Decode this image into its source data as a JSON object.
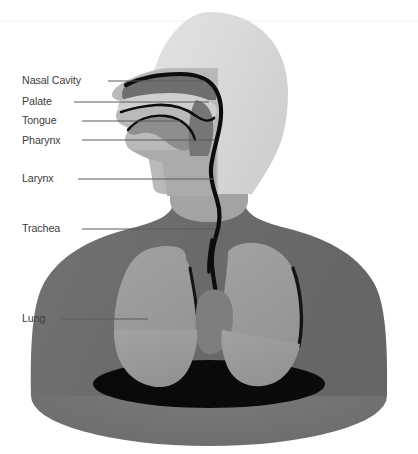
{
  "figure": {
    "width": 418,
    "height": 454,
    "background_color": "#ffffff"
  },
  "palette": {
    "background": "#ffffff",
    "skull_light": "#dcdcdc",
    "head_mid": "#c8c8c8",
    "face_shade": "#b4b4b4",
    "neck": "#a8a8a8",
    "torso": "#6e6e6e",
    "torso_base": "#757575",
    "lung": "#9a9a9a",
    "airway_dark": "#555555",
    "nasal_cavity": "#6f6f6f",
    "outline_black": "#0d0d0d",
    "shadow_black": "#0a0a0a",
    "label_text": "#3c3c3c",
    "leader_line": "#5a5a5a"
  },
  "labels": [
    {
      "id": "nasal-cavity",
      "text": "Nasal Cavity",
      "text_x": 22,
      "text_y": 74,
      "line_x1": 108,
      "line_x2": 205,
      "line_y": 81
    },
    {
      "id": "palate",
      "text": "Palate",
      "text_x": 22,
      "text_y": 95,
      "line_x1": 74,
      "line_x2": 209,
      "line_y": 102
    },
    {
      "id": "tongue",
      "text": "Tongue",
      "text_x": 22,
      "text_y": 114,
      "line_x1": 82,
      "line_x2": 180,
      "line_y": 121
    },
    {
      "id": "pharynx",
      "text": "Pharynx",
      "text_x": 22,
      "text_y": 134,
      "line_x1": 82,
      "line_x2": 215,
      "line_y": 140
    },
    {
      "id": "larynx",
      "text": "Larynx",
      "text_x": 22,
      "text_y": 172,
      "line_x1": 78,
      "line_x2": 214,
      "line_y": 179
    },
    {
      "id": "trachea",
      "text": "Trachea",
      "text_x": 22,
      "text_y": 222,
      "line_x1": 82,
      "line_x2": 215,
      "line_y": 229
    },
    {
      "id": "lung",
      "text": "Lung",
      "text_x": 22,
      "text_y": 312,
      "line_x1": 62,
      "line_x2": 148,
      "line_y": 319
    }
  ],
  "anatomy_parts": [
    {
      "id": "skull",
      "name": "Skull / head outline"
    },
    {
      "id": "face",
      "name": "Face profile"
    },
    {
      "id": "neck",
      "name": "Neck"
    },
    {
      "id": "torso",
      "name": "Torso and shoulders"
    },
    {
      "id": "nasal-cavity-shape",
      "name": "Nasal cavity"
    },
    {
      "id": "palate-shape",
      "name": "Palate"
    },
    {
      "id": "tongue-shape",
      "name": "Tongue"
    },
    {
      "id": "pharynx-shape",
      "name": "Pharynx"
    },
    {
      "id": "larynx-shape",
      "name": "Larynx"
    },
    {
      "id": "trachea-shape",
      "name": "Trachea"
    },
    {
      "id": "left-lung-shape",
      "name": "Left lung"
    },
    {
      "id": "right-lung-shape",
      "name": "Right lung"
    },
    {
      "id": "base-shadow",
      "name": "Base shadow ellipse"
    }
  ]
}
